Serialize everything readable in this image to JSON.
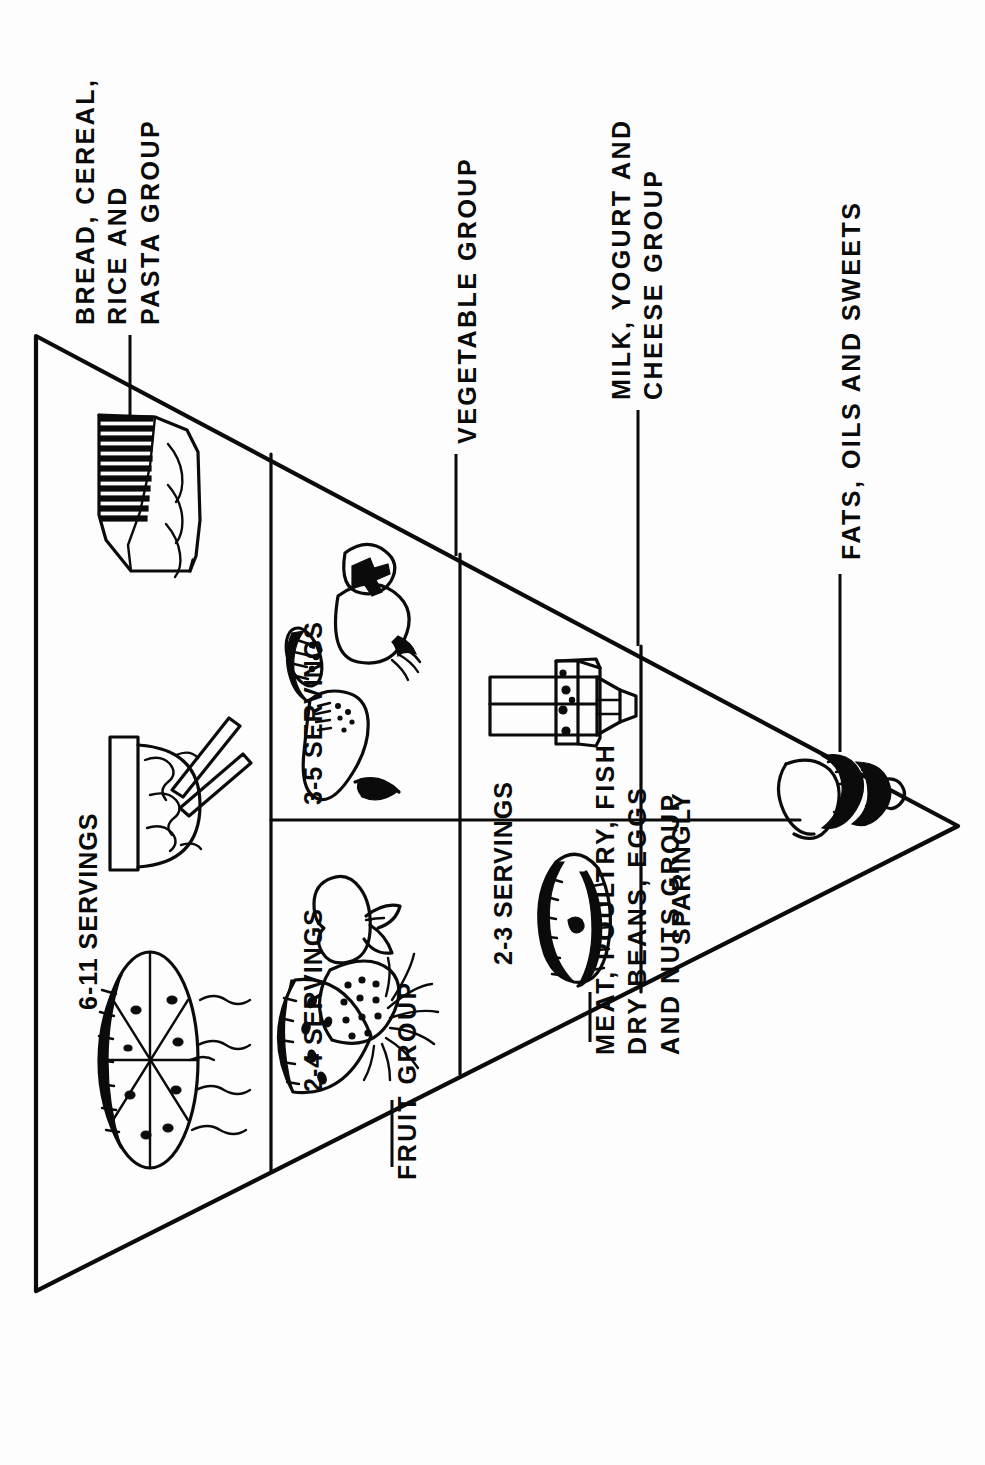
{
  "figure": {
    "orientation": "rotated-90-clockwise",
    "background_color": "#ffffff",
    "ink_color": "#000000"
  },
  "outer_labels": [
    {
      "id": "fats-oils-sweets",
      "line1": "FATS, OILS AND SWEETS",
      "line2": ""
    },
    {
      "id": "milk-yogurt-cheese",
      "line1": "MILK, YOGURT AND",
      "line2": "CHEESE GROUP"
    },
    {
      "id": "vegetable-group",
      "line1": "VEGETABLE GROUP",
      "line2": ""
    },
    {
      "id": "bread-cereal-rice-pasta",
      "line1": "BREAD, CEREAL,",
      "line2": "RICE AND",
      "line3": "PASTA GROUP"
    },
    {
      "id": "meat-poultry-fish",
      "line1": "MEAT, POULTRY, FISH",
      "line2": "DRY BEANS, EGGS",
      "line3": "AND NUTS GROUP"
    },
    {
      "id": "fruit-group",
      "line1": "FRUIT GROUP",
      "line2": ""
    }
  ],
  "tiers": [
    {
      "id": "tier-apex",
      "servings": "SPARINGLY",
      "group": "FATS, OILS AND SWEETS",
      "icons": [
        "ice-cream-cone-icon"
      ]
    },
    {
      "id": "tier-milk",
      "servings": "2-3 SERVINGS",
      "group": "MILK, YOGURT AND CHEESE GROUP",
      "icons": [
        "cheese-wedge-icon",
        "milk-carton-icon"
      ]
    },
    {
      "id": "tier-meat",
      "servings": "2-3 SERVINGS",
      "group": "MEAT, POULTRY, FISH, DRY BEANS, EGGS AND NUTS GROUP",
      "icons": [
        "meat-cut-icon"
      ]
    },
    {
      "id": "tier-vegetable",
      "servings": "3-5 SERVINGS",
      "group": "VEGETABLE GROUP",
      "icons": [
        "broccoli-icon",
        "cucumber-slice-icon",
        "carrot-icon"
      ]
    },
    {
      "id": "tier-fruit",
      "servings": "2-4 SERVINGS",
      "group": "FRUIT GROUP",
      "icons": [
        "apple-icon",
        "watermelon-slice-icon",
        "pineapple-icon"
      ]
    },
    {
      "id": "tier-grain",
      "servings": "6-11 SERVINGS",
      "group": "BREAD, CEREAL, RICE AND PASTA GROUP",
      "icons": [
        "bread-loaf-icon",
        "rice-bowl-chopsticks-icon",
        "pie-slice-wheel-icon"
      ]
    }
  ],
  "servings_text": {
    "sparingly": "SPARINGLY",
    "milk": "2-3 SERVINGS",
    "vegetable": "3-5 SERVINGS",
    "fruit": "2-4 SERVINGS",
    "grain": "6-11 SERVINGS"
  }
}
